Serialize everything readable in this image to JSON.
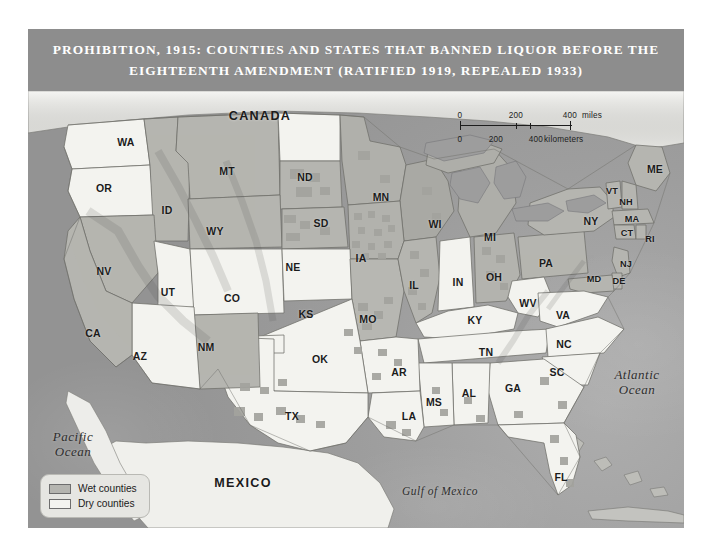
{
  "title": {
    "line1": "PROHIBITION, 1915: COUNTIES AND STATES THAT BANNED LIQUOR BEFORE THE",
    "line2": "EIGHTEENTH AMENDMENT (RATIFIED 1919, REPEALED 1933)"
  },
  "colors": {
    "banner": "#8d8d8d",
    "banner_text": "#ffffff",
    "ocean": "#9a9a9a",
    "dry_county": "#f3f3ef",
    "wet_county": "#b5b5b0",
    "border": "#6d6d6d",
    "label_text": "#1b1b1b",
    "legend_background": "#e6e6e2"
  },
  "legend": {
    "items": [
      {
        "label": "Wet counties",
        "swatch": "wet"
      },
      {
        "label": "Dry counties",
        "swatch": "dry"
      }
    ]
  },
  "scale_bar": {
    "miles": {
      "unit": "miles",
      "ticks": [
        "0",
        "200",
        "400"
      ]
    },
    "kilometers": {
      "unit": "kilometers",
      "ticks": [
        "0",
        "200",
        "400"
      ]
    }
  },
  "countries": [
    {
      "name": "CANADA",
      "x": 232,
      "y": 25
    },
    {
      "name": "MEXICO",
      "x": 215,
      "y": 392
    }
  ],
  "water_bodies": [
    {
      "name": "Pacific\nOcean",
      "x": 45,
      "y": 353,
      "size": "normal"
    },
    {
      "name": "Atlantic\nOcean",
      "x": 609,
      "y": 291,
      "size": "normal"
    },
    {
      "name": "Gulf of Mexico",
      "x": 412,
      "y": 400,
      "size": "small"
    }
  ],
  "states": [
    {
      "code": "WA",
      "x": 98,
      "y": 51,
      "status": "dry"
    },
    {
      "code": "OR",
      "x": 76,
      "y": 97,
      "status": "dry"
    },
    {
      "code": "ID",
      "x": 139,
      "y": 119,
      "status": "wet"
    },
    {
      "code": "MT",
      "x": 199,
      "y": 80,
      "status": "wet"
    },
    {
      "code": "ND",
      "x": 277,
      "y": 86,
      "status": "dry"
    },
    {
      "code": "MN",
      "x": 353,
      "y": 106,
      "status": "wet"
    },
    {
      "code": "WI",
      "x": 407,
      "y": 133,
      "status": "wet"
    },
    {
      "code": "MI",
      "x": 462,
      "y": 146,
      "status": "wet"
    },
    {
      "code": "SD",
      "x": 293,
      "y": 132,
      "status": "wet"
    },
    {
      "code": "WY",
      "x": 187,
      "y": 140,
      "status": "wet"
    },
    {
      "code": "NV",
      "x": 76,
      "y": 180,
      "status": "wet"
    },
    {
      "code": "UT",
      "x": 140,
      "y": 201,
      "status": "dry"
    },
    {
      "code": "CO",
      "x": 204,
      "y": 207,
      "status": "dry"
    },
    {
      "code": "NE",
      "x": 265,
      "y": 176,
      "status": "wet"
    },
    {
      "code": "IA",
      "x": 333,
      "y": 167,
      "status": "wet"
    },
    {
      "code": "IL",
      "x": 386,
      "y": 194,
      "status": "wet"
    },
    {
      "code": "IN",
      "x": 430,
      "y": 191,
      "status": "dry"
    },
    {
      "code": "OH",
      "x": 466,
      "y": 186,
      "status": "wet"
    },
    {
      "code": "PA",
      "x": 518,
      "y": 172,
      "status": "wet"
    },
    {
      "code": "NY",
      "x": 563,
      "y": 130,
      "status": "wet"
    },
    {
      "code": "ME",
      "x": 627,
      "y": 78,
      "status": "wet"
    },
    {
      "code": "VT",
      "x": 584,
      "y": 100,
      "status": "wet"
    },
    {
      "code": "NH",
      "x": 598,
      "y": 111,
      "status": "wet"
    },
    {
      "code": "MA",
      "x": 604,
      "y": 128,
      "status": "wet"
    },
    {
      "code": "CT",
      "x": 599,
      "y": 142,
      "status": "wet"
    },
    {
      "code": "RI",
      "x": 622,
      "y": 148,
      "status": "wet"
    },
    {
      "code": "NJ",
      "x": 598,
      "y": 173,
      "status": "wet"
    },
    {
      "code": "DE",
      "x": 591,
      "y": 190,
      "status": "wet"
    },
    {
      "code": "MD",
      "x": 566,
      "y": 188,
      "status": "wet"
    },
    {
      "code": "WV",
      "x": 500,
      "y": 212,
      "status": "dry"
    },
    {
      "code": "VA",
      "x": 535,
      "y": 224,
      "status": "dry"
    },
    {
      "code": "KS",
      "x": 278,
      "y": 223,
      "status": "dry"
    },
    {
      "code": "MO",
      "x": 340,
      "y": 228,
      "status": "wet"
    },
    {
      "code": "KY",
      "x": 447,
      "y": 229,
      "status": "dry"
    },
    {
      "code": "TN",
      "x": 458,
      "y": 261,
      "status": "dry"
    },
    {
      "code": "NC",
      "x": 536,
      "y": 253,
      "status": "dry"
    },
    {
      "code": "SC",
      "x": 529,
      "y": 281,
      "status": "dry"
    },
    {
      "code": "GA",
      "x": 485,
      "y": 297,
      "status": "dry"
    },
    {
      "code": "AL",
      "x": 441,
      "y": 302,
      "status": "dry"
    },
    {
      "code": "MS",
      "x": 406,
      "y": 311,
      "status": "dry"
    },
    {
      "code": "AR",
      "x": 371,
      "y": 281,
      "status": "dry"
    },
    {
      "code": "LA",
      "x": 381,
      "y": 325,
      "status": "dry"
    },
    {
      "code": "OK",
      "x": 292,
      "y": 268,
      "status": "dry"
    },
    {
      "code": "TX",
      "x": 264,
      "y": 325,
      "status": "dry"
    },
    {
      "code": "NM",
      "x": 178,
      "y": 256,
      "status": "wet"
    },
    {
      "code": "AZ",
      "x": 112,
      "y": 265,
      "status": "dry"
    },
    {
      "code": "CA",
      "x": 65,
      "y": 242,
      "status": "wet"
    },
    {
      "code": "FL",
      "x": 533,
      "y": 386,
      "status": "dry"
    }
  ]
}
